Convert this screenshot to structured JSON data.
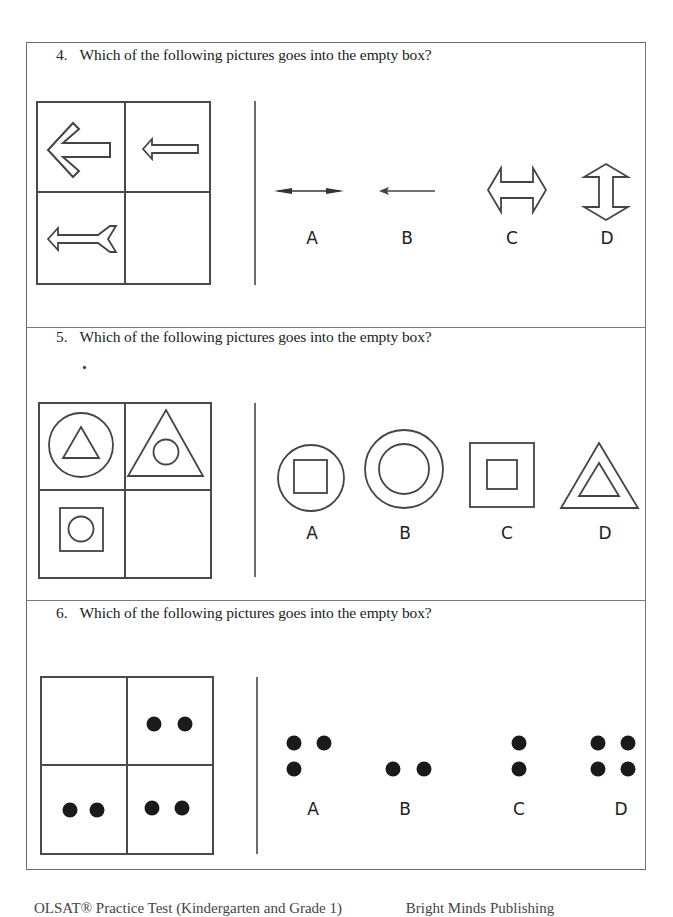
{
  "questions": [
    {
      "number": "4.",
      "prompt": "Which of the following pictures goes into the empty box?",
      "matrix": {
        "top_left": "large-left-arrow-outline",
        "top_right": "small-left-arrow-outline",
        "bottom_left": "left-arrow-with-fletching-outline",
        "bottom_right": "empty"
      },
      "options": [
        {
          "label": "A",
          "figure": "thin double-headed horizontal arrow"
        },
        {
          "label": "B",
          "figure": "thin left-pointing arrow"
        },
        {
          "label": "C",
          "figure": "outlined double-headed horizontal arrow"
        },
        {
          "label": "D",
          "figure": "outlined double-headed vertical arrow"
        }
      ]
    },
    {
      "number": "5.",
      "prompt": "Which of the following pictures goes into the empty box?",
      "matrix": {
        "top_left": "circle containing triangle",
        "top_right": "triangle containing circle",
        "bottom_left": "square containing circle",
        "bottom_right": "empty"
      },
      "options": [
        {
          "label": "A",
          "figure": "circle containing square"
        },
        {
          "label": "B",
          "figure": "circle containing circle"
        },
        {
          "label": "C",
          "figure": "square containing square"
        },
        {
          "label": "D",
          "figure": "triangle containing triangle"
        }
      ]
    },
    {
      "number": "6.",
      "prompt": "Which of the following pictures goes into the empty box?",
      "matrix": {
        "top_left": "empty",
        "top_right": "two dots in a row",
        "bottom_left": "two dots in a row",
        "bottom_right": "two dots in a row"
      },
      "options": [
        {
          "label": "A",
          "figure": "three dots (L-shape)"
        },
        {
          "label": "B",
          "figure": "two dots horizontal"
        },
        {
          "label": "C",
          "figure": "two dots vertical"
        },
        {
          "label": "D",
          "figure": "four dots square"
        }
      ]
    }
  ],
  "footer": {
    "left": "OLSAT® Practice Test (Kindergarten and Grade 1)",
    "right": "Bright Minds Publishing"
  },
  "colors": {
    "line": "#4a4a4a",
    "dot": "#1a1a1a",
    "text": "#222222"
  }
}
